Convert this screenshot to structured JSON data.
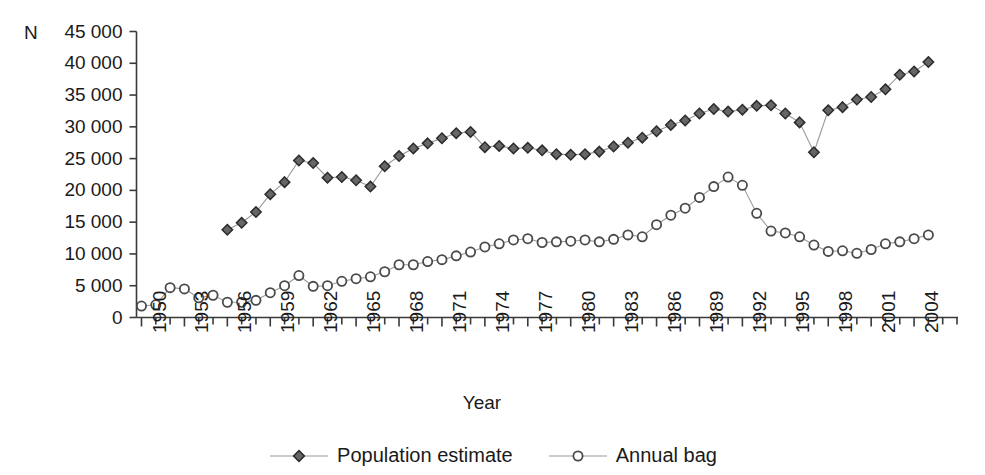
{
  "chart_data": {
    "type": "line",
    "title": "",
    "xlabel": "Year",
    "ylabel": "N",
    "ylim": [
      0,
      45000
    ],
    "xlim": [
      1949.5,
      2006.5
    ],
    "grid": false,
    "legend_position": "bottom-center",
    "y_ticks": [
      0,
      5000,
      10000,
      15000,
      20000,
      25000,
      30000,
      35000,
      40000,
      45000
    ],
    "y_tick_labels": [
      "0",
      "5 000",
      "10 000",
      "15 000",
      "20 000",
      "25 000",
      "30 000",
      "35 000",
      "40 000",
      "45 000"
    ],
    "x_tick_labels": [
      "1950",
      "1953",
      "1956",
      "1959",
      "1962",
      "1965",
      "1968",
      "1971",
      "1974",
      "1977",
      "1980",
      "1983",
      "1986",
      "1989",
      "1992",
      "1995",
      "1998",
      "2001",
      "2004"
    ],
    "x_tick_label_step": 3,
    "x_minor_tick_step": 1,
    "series": [
      {
        "name": "Population estimate",
        "marker": "diamond",
        "color": "#4d4d4d",
        "marker_fill": "#666666",
        "x": [
          1956,
          1957,
          1958,
          1959,
          1960,
          1961,
          1962,
          1963,
          1964,
          1965,
          1966,
          1967,
          1968,
          1969,
          1970,
          1971,
          1972,
          1973,
          1974,
          1975,
          1976,
          1977,
          1978,
          1979,
          1980,
          1981,
          1982,
          1983,
          1984,
          1985,
          1986,
          1987,
          1988,
          1989,
          1990,
          1991,
          1992,
          1993,
          1994,
          1995,
          1996,
          1997,
          1998,
          1999,
          2000,
          2001,
          2002,
          2003,
          2004,
          2005
        ],
        "values": [
          13800,
          14900,
          16600,
          19400,
          21300,
          24700,
          24300,
          22000,
          22100,
          21600,
          20600,
          23800,
          25400,
          26600,
          27400,
          28200,
          29000,
          29200,
          26800,
          27000,
          26600,
          26700,
          26300,
          25700,
          25600,
          25700,
          26100,
          26900,
          27500,
          28300,
          29300,
          30300,
          31000,
          32100,
          32800,
          32400,
          32700,
          33300,
          33400,
          32100,
          30700,
          26000,
          32600,
          33100,
          34300,
          34700,
          35900,
          38200,
          38700,
          40200
        ]
      },
      {
        "name": "Annual bag",
        "marker": "circle",
        "color": "#4d4d4d",
        "marker_fill": "#ffffff",
        "x": [
          1950,
          1951,
          1952,
          1953,
          1954,
          1955,
          1956,
          1957,
          1958,
          1959,
          1960,
          1961,
          1962,
          1963,
          1964,
          1965,
          1966,
          1967,
          1968,
          1969,
          1970,
          1971,
          1972,
          1973,
          1974,
          1975,
          1976,
          1977,
          1978,
          1979,
          1980,
          1981,
          1982,
          1983,
          1984,
          1985,
          1986,
          1987,
          1988,
          1989,
          1990,
          1991,
          1992,
          1993,
          1994,
          1995,
          1996,
          1997,
          1998,
          1999,
          2000,
          2001,
          2002,
          2003,
          2004,
          2005
        ],
        "values": [
          1800,
          2000,
          4700,
          4500,
          3100,
          3500,
          2400,
          2400,
          2700,
          3900,
          5000,
          6600,
          4900,
          5000,
          5700,
          6100,
          6400,
          7200,
          8300,
          8300,
          8800,
          9100,
          9700,
          10300,
          11100,
          11600,
          12200,
          12400,
          11800,
          11900,
          12000,
          12200,
          11900,
          12300,
          13000,
          12700,
          14600,
          16100,
          17200,
          18900,
          20600,
          22100,
          20800,
          16400,
          13600,
          13300,
          12700,
          11400,
          10400,
          10500,
          10100,
          10700,
          11600,
          11900,
          12400,
          13000
        ]
      }
    ]
  },
  "legend": {
    "items": [
      {
        "label": "Population estimate",
        "marker": "diamond"
      },
      {
        "label": "Annual bag",
        "marker": "circle"
      }
    ]
  }
}
